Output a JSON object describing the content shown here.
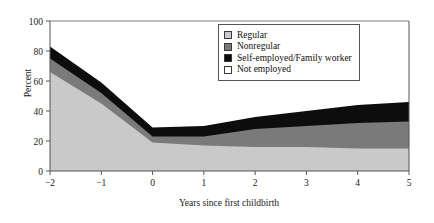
{
  "chart_data": {
    "type": "area",
    "stacked": true,
    "title": "",
    "xlabel": "Years since first childbirth",
    "ylabel": "Percent",
    "x": [
      -2,
      -1,
      0,
      1,
      2,
      3,
      4,
      5
    ],
    "xticklabels": [
      "−2",
      "−1",
      "0",
      "1",
      "2",
      "3",
      "4",
      "5"
    ],
    "xlim": [
      -2,
      5
    ],
    "ylim": [
      0,
      100
    ],
    "yticks": [
      0,
      20,
      40,
      60,
      80,
      100
    ],
    "yticklabels": [
      "0",
      "20",
      "40",
      "60",
      "80",
      "100"
    ],
    "grid": false,
    "legend_position": "top-right",
    "series": [
      {
        "name": "Regular",
        "color": "#c9c9c9",
        "values": [
          66,
          45,
          19,
          17,
          16,
          16,
          15,
          15
        ]
      },
      {
        "name": "Nonregular",
        "color": "#7a7a7a",
        "values": [
          9,
          7,
          4,
          6,
          12,
          14,
          17,
          18
        ]
      },
      {
        "name": "Self-employed/Family worker",
        "color": "#0d0d0d",
        "values": [
          8,
          7,
          6,
          7,
          8,
          10,
          12,
          13
        ]
      },
      {
        "name": "Not employed",
        "color": "#ffffff",
        "values": [
          17,
          41,
          71,
          70,
          64,
          60,
          56,
          54
        ]
      }
    ],
    "cumulative_tops": {
      "regular": [
        66,
        45,
        19,
        17,
        16,
        16,
        15,
        15
      ],
      "regular_plus_nonregular": [
        75,
        52,
        23,
        23,
        28,
        30,
        32,
        33
      ],
      "total_employed": [
        83,
        59,
        29,
        30,
        36,
        40,
        44,
        46
      ]
    }
  },
  "legend": {
    "items": [
      {
        "label": "Regular",
        "swatch": "#c9c9c9"
      },
      {
        "label": "Nonregular",
        "swatch": "#7a7a7a"
      },
      {
        "label": "Self-employed/Family worker",
        "swatch": "#0d0d0d"
      },
      {
        "label": "Not employed",
        "swatch": "#ffffff"
      }
    ]
  },
  "axes": {
    "ylabel": "Percent",
    "xlabel": "Years since first childbirth",
    "yticks": [
      "100",
      "80",
      "60",
      "40",
      "20",
      "0"
    ],
    "xticks": [
      "−2",
      "−1",
      "0",
      "1",
      "2",
      "3",
      "4",
      "5"
    ]
  }
}
